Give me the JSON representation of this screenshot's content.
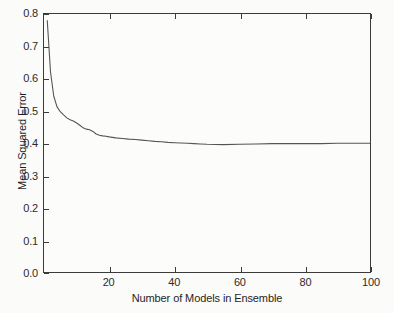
{
  "chart_data": {
    "type": "line",
    "title": "",
    "xlabel": "Number of Models in Ensemble",
    "ylabel": "Mean Squared Error",
    "xlim": [
      0,
      100
    ],
    "ylim": [
      0.0,
      0.8
    ],
    "grid": false,
    "legend": null,
    "line_color": "#555555",
    "xticks": [
      20,
      40,
      60,
      80,
      100
    ],
    "xtick_labels": [
      "20",
      "40",
      "60",
      "80",
      "100"
    ],
    "yticks": [
      0.0,
      0.1,
      0.2,
      0.3,
      0.4,
      0.5,
      0.6,
      0.7,
      0.8
    ],
    "ytick_labels": [
      "0.0",
      "0.1",
      "0.2",
      "0.3",
      "0.4",
      "0.5",
      "0.6",
      "0.7",
      "0.8"
    ],
    "series": [
      {
        "name": "Mean Squared Error",
        "x": [
          1,
          2,
          3,
          4,
          5,
          6,
          7,
          8,
          9,
          10,
          11,
          12,
          13,
          14,
          15,
          16,
          17,
          18,
          19,
          20,
          22,
          24,
          26,
          28,
          30,
          32,
          34,
          36,
          38,
          40,
          42,
          44,
          46,
          48,
          50,
          55,
          60,
          65,
          70,
          75,
          80,
          85,
          90,
          95,
          100
        ],
        "values": [
          0.78,
          0.62,
          0.545,
          0.512,
          0.497,
          0.487,
          0.478,
          0.472,
          0.468,
          0.462,
          0.455,
          0.447,
          0.443,
          0.441,
          0.436,
          0.428,
          0.424,
          0.422,
          0.421,
          0.419,
          0.416,
          0.414,
          0.412,
          0.411,
          0.409,
          0.407,
          0.405,
          0.404,
          0.402,
          0.401,
          0.4,
          0.399,
          0.398,
          0.397,
          0.396,
          0.395,
          0.396,
          0.397,
          0.398,
          0.398,
          0.398,
          0.398,
          0.399,
          0.399,
          0.399
        ]
      }
    ]
  }
}
